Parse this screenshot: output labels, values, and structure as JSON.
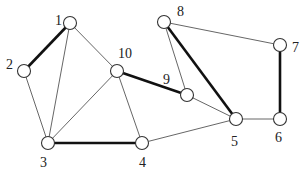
{
  "diagram": {
    "type": "undirected-graph",
    "nodes": [
      {
        "id": "1",
        "x": 70,
        "y": 23,
        "lx": 55,
        "ly": 25
      },
      {
        "id": "2",
        "x": 24,
        "y": 71,
        "lx": 6,
        "ly": 69
      },
      {
        "id": "3",
        "x": 48,
        "y": 143,
        "lx": 40,
        "ly": 167
      },
      {
        "id": "4",
        "x": 142,
        "y": 143,
        "lx": 139,
        "ly": 167
      },
      {
        "id": "5",
        "x": 236,
        "y": 119,
        "lx": 231,
        "ly": 146
      },
      {
        "id": "6",
        "x": 280,
        "y": 119,
        "lx": 275,
        "ly": 142
      },
      {
        "id": "7",
        "x": 280,
        "y": 45,
        "lx": 292,
        "ly": 52
      },
      {
        "id": "8",
        "x": 164,
        "y": 22,
        "lx": 177,
        "ly": 16
      },
      {
        "id": "9",
        "x": 187,
        "y": 95,
        "lx": 163,
        "ly": 84
      },
      {
        "id": "10",
        "x": 117,
        "y": 71,
        "lx": 118,
        "ly": 58
      }
    ],
    "edges": [
      {
        "from": "1",
        "to": "2",
        "thick": true
      },
      {
        "from": "1",
        "to": "3",
        "thick": false
      },
      {
        "from": "1",
        "to": "10",
        "thick": false
      },
      {
        "from": "2",
        "to": "3",
        "thick": false
      },
      {
        "from": "10",
        "to": "3",
        "thick": false
      },
      {
        "from": "10",
        "to": "4",
        "thick": false
      },
      {
        "from": "10",
        "to": "9",
        "thick": true
      },
      {
        "from": "3",
        "to": "4",
        "thick": true
      },
      {
        "from": "4",
        "to": "5",
        "thick": false
      },
      {
        "from": "9",
        "to": "8",
        "thick": false
      },
      {
        "from": "9",
        "to": "5",
        "thick": false
      },
      {
        "from": "8",
        "to": "5",
        "thick": true
      },
      {
        "from": "8",
        "to": "7",
        "thick": false
      },
      {
        "from": "7",
        "to": "6",
        "thick": true
      },
      {
        "from": "5",
        "to": "6",
        "thick": false
      }
    ],
    "node_radius": 6.5,
    "colors": {
      "thin_edge": "#555555",
      "thick_edge": "#111111",
      "node_fill": "#ffffff",
      "node_stroke": "#333333"
    }
  }
}
